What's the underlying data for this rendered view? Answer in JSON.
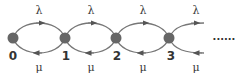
{
  "diagram": {
    "type": "birth-death-chain",
    "states": [
      {
        "label": "0",
        "x": 13
      },
      {
        "label": "1",
        "x": 65
      },
      {
        "label": "2",
        "x": 116
      },
      {
        "label": "3",
        "x": 169
      }
    ],
    "forward_rate_label": "λ",
    "backward_rate_label": "μ",
    "transitions": [
      {
        "from": "0",
        "to": "1",
        "forward": "λ",
        "backward": "μ"
      },
      {
        "from": "1",
        "to": "2",
        "forward": "λ",
        "backward": "μ"
      },
      {
        "from": "2",
        "to": "3",
        "forward": "λ",
        "backward": "μ"
      },
      {
        "from": "3",
        "to": "…",
        "forward": "λ",
        "backward": "μ"
      }
    ],
    "continuation": "......",
    "colors": {
      "node": "#666666",
      "edge": "#777777",
      "arrow": "#555555",
      "text": "#333333"
    }
  }
}
